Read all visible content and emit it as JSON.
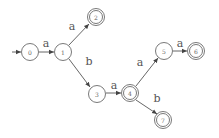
{
  "diagram": {
    "type": "finite-automaton",
    "start_state": "0",
    "nodes": [
      {
        "id": "0",
        "label": "0",
        "x": 30,
        "y": 52,
        "accepting": false
      },
      {
        "id": "1",
        "label": "1",
        "x": 63,
        "y": 52,
        "accepting": false
      },
      {
        "id": "2",
        "label": "2",
        "x": 96,
        "y": 17,
        "accepting": true
      },
      {
        "id": "3",
        "label": "3",
        "x": 97,
        "y": 94,
        "accepting": false
      },
      {
        "id": "4",
        "label": "4",
        "x": 130,
        "y": 93,
        "accepting": true
      },
      {
        "id": "5",
        "label": "5",
        "x": 164,
        "y": 51,
        "accepting": false
      },
      {
        "id": "6",
        "label": "6",
        "x": 196,
        "y": 51,
        "accepting": true
      },
      {
        "id": "7",
        "label": "7",
        "x": 163,
        "y": 120,
        "accepting": true
      }
    ],
    "edges": [
      {
        "from": "0",
        "to": "1",
        "label": "a"
      },
      {
        "from": "1",
        "to": "2",
        "label": "a"
      },
      {
        "from": "1",
        "to": "3",
        "label": "b"
      },
      {
        "from": "3",
        "to": "4",
        "label": "a"
      },
      {
        "from": "4",
        "to": "5",
        "label": "a"
      },
      {
        "from": "4",
        "to": "7",
        "label": "b"
      },
      {
        "from": "5",
        "to": "6",
        "label": "a"
      }
    ]
  }
}
